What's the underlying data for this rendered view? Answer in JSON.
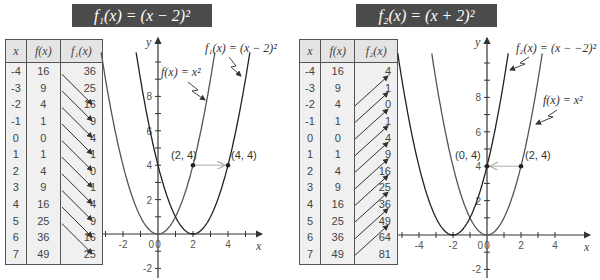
{
  "left": {
    "title": "f₁(x) = (x − 2)²",
    "table": {
      "headers": [
        "x",
        "f(x)",
        "f₁(x)"
      ],
      "rows": [
        [
          "-4",
          "16",
          "36"
        ],
        [
          "-3",
          "9",
          "25"
        ],
        [
          "-2",
          "4",
          "16"
        ],
        [
          "-1",
          "1",
          "9"
        ],
        [
          "0",
          "0",
          "4"
        ],
        [
          "1",
          "1",
          "1"
        ],
        [
          "2",
          "4",
          "0"
        ],
        [
          "3",
          "9",
          "1"
        ],
        [
          "4",
          "16",
          "4"
        ],
        [
          "5",
          "25",
          "9"
        ],
        [
          "6",
          "36",
          "16"
        ],
        [
          "7",
          "49",
          "25"
        ]
      ]
    },
    "graph": {
      "y_label": "y",
      "x_label": "x",
      "label_parent": "f(x) = x²",
      "label_shifted": "f₁(x) = (x − 2)²",
      "point_a": "(2, 4)",
      "point_b": "(4, 4)"
    }
  },
  "right": {
    "title": "f₂(x) = (x + 2)²",
    "table": {
      "headers": [
        "x",
        "f(x)",
        "f₂(x)"
      ],
      "rows": [
        [
          "-4",
          "16",
          "4"
        ],
        [
          "-3",
          "9",
          "1"
        ],
        [
          "-2",
          "4",
          "0"
        ],
        [
          "-1",
          "1",
          "1"
        ],
        [
          "0",
          "0",
          "4"
        ],
        [
          "1",
          "1",
          "9"
        ],
        [
          "2",
          "4",
          "16"
        ],
        [
          "3",
          "9",
          "25"
        ],
        [
          "4",
          "16",
          "36"
        ],
        [
          "5",
          "25",
          "49"
        ],
        [
          "6",
          "36",
          "64"
        ],
        [
          "7",
          "49",
          "81"
        ]
      ]
    },
    "graph": {
      "y_label": "y",
      "x_label": "x",
      "label_parent": "f(x) = x²",
      "label_shifted": "f₂(x) = (x − −2)²",
      "point_a": "(0, 4)",
      "point_b": "(2, 4)"
    }
  },
  "chart_data": [
    {
      "type": "line",
      "title": "f₁(x) = (x − 2)²",
      "xlabel": "x",
      "ylabel": "y",
      "xticks": [
        -2,
        0,
        2,
        4
      ],
      "yticks": [
        -2,
        2,
        4,
        6,
        8
      ],
      "xlim": [
        -3.5,
        5.5
      ],
      "ylim": [
        -2.5,
        10.5
      ],
      "series": [
        {
          "name": "f(x) = x²",
          "x": [
            -3,
            -2,
            -1,
            0,
            1,
            2,
            3
          ],
          "y": [
            9,
            4,
            1,
            0,
            1,
            4,
            9
          ]
        },
        {
          "name": "f₁(x) = (x − 2)²",
          "x": [
            -1,
            0,
            1,
            2,
            3,
            4,
            5
          ],
          "y": [
            9,
            4,
            1,
            0,
            1,
            4,
            9
          ]
        }
      ],
      "annotations": [
        {
          "text": "(2, 4)",
          "x": 2,
          "y": 4
        },
        {
          "text": "(4, 4)",
          "x": 4,
          "y": 4
        },
        {
          "text": "arrow shift right 2 units",
          "from": [
            2,
            4
          ],
          "to": [
            4,
            4
          ]
        }
      ],
      "grid": false
    },
    {
      "type": "line",
      "title": "f₂(x) = (x + 2)²",
      "xlabel": "x",
      "ylabel": "y",
      "xticks": [
        -4,
        -2,
        0,
        2,
        4
      ],
      "yticks": [
        -2,
        2,
        4,
        6,
        8
      ],
      "xlim": [
        -5.5,
        4.5
      ],
      "ylim": [
        -2.5,
        10.5
      ],
      "series": [
        {
          "name": "f(x) = x²",
          "x": [
            -3,
            -2,
            -1,
            0,
            1,
            2,
            3
          ],
          "y": [
            9,
            4,
            1,
            0,
            1,
            4,
            9
          ]
        },
        {
          "name": "f₂(x) = (x + 2)²",
          "x": [
            -5,
            -4,
            -3,
            -2,
            -1,
            0,
            1
          ],
          "y": [
            9,
            4,
            1,
            0,
            1,
            4,
            9
          ]
        }
      ],
      "annotations": [
        {
          "text": "(0, 4)",
          "x": 0,
          "y": 4
        },
        {
          "text": "(2, 4)",
          "x": 2,
          "y": 4
        },
        {
          "text": "arrow shift left 2 units",
          "from": [
            2,
            4
          ],
          "to": [
            0,
            4
          ]
        }
      ],
      "grid": false
    }
  ],
  "colors": {
    "title_bar": "#4b4b4b",
    "table_header": "#e4e4e4",
    "curve": "#333333",
    "shift_arrow": "#bbbbbb"
  }
}
